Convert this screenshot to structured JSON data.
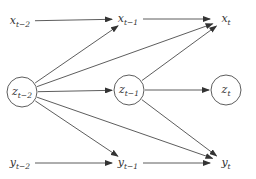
{
  "diagram": {
    "type": "graphical-model",
    "nodes": [
      {
        "id": "x_t-2",
        "base": "x",
        "sub": "t−2",
        "x": 20,
        "y": 21,
        "circle": false
      },
      {
        "id": "x_t-1",
        "base": "x",
        "sub": "t−1",
        "x": 128,
        "y": 19,
        "circle": false
      },
      {
        "id": "x_t",
        "base": "x",
        "sub": "t",
        "x": 226,
        "y": 19,
        "circle": false
      },
      {
        "id": "z_t-2",
        "base": "z",
        "sub": "t−2",
        "x": 22,
        "y": 92,
        "circle": true
      },
      {
        "id": "z_t-1",
        "base": "z",
        "sub": "t−1",
        "x": 129,
        "y": 90,
        "circle": true
      },
      {
        "id": "z_t",
        "base": "z",
        "sub": "t",
        "x": 226,
        "y": 90,
        "circle": true
      },
      {
        "id": "y_t-2",
        "base": "y",
        "sub": "t−2",
        "x": 20,
        "y": 163,
        "circle": false
      },
      {
        "id": "y_t-1",
        "base": "y",
        "sub": "t−1",
        "x": 128,
        "y": 163,
        "circle": false
      },
      {
        "id": "y_t",
        "base": "y",
        "sub": "t",
        "x": 226,
        "y": 163,
        "circle": false
      }
    ],
    "edges": [
      {
        "from": "x_t-2",
        "to": "x_t-1"
      },
      {
        "from": "x_t-1",
        "to": "x_t"
      },
      {
        "from": "z_t-2",
        "to": "x_t-1"
      },
      {
        "from": "z_t-2",
        "to": "x_t"
      },
      {
        "from": "z_t-1",
        "to": "x_t"
      },
      {
        "from": "z_t-2",
        "to": "z_t-1"
      },
      {
        "from": "z_t-1",
        "to": "z_t"
      },
      {
        "from": "z_t-2",
        "to": "y_t-1"
      },
      {
        "from": "z_t-2",
        "to": "y_t"
      },
      {
        "from": "z_t-1",
        "to": "y_t"
      },
      {
        "from": "y_t-2",
        "to": "y_t-1"
      },
      {
        "from": "y_t-1",
        "to": "y_t"
      }
    ],
    "colors": {
      "stroke": "#333333",
      "background": "#ffffff"
    }
  }
}
